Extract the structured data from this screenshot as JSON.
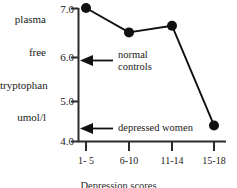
{
  "chart_data": {
    "type": "line",
    "title": "",
    "subtitle": "",
    "xlabel": "Depression scores",
    "ylabel": "plasma free tryptophan umol/l",
    "ylabel_lines": [
      "plasma",
      "free",
      "tryptophan",
      "umol/l"
    ],
    "categories": [
      "1- 5",
      "6-10",
      "11-14",
      "15-18"
    ],
    "values": [
      7.0,
      6.45,
      6.6,
      4.35
    ],
    "series": [
      {
        "name": "plasma free tryptophan",
        "values": [
          7.0,
          6.45,
          6.6,
          4.35
        ]
      }
    ],
    "ylim": [
      4.0,
      7.0
    ],
    "yticks": [
      "7.0",
      "6.0",
      "5.0",
      "4.0"
    ],
    "ytick_values": [
      7.0,
      6.0,
      5.0,
      4.0
    ],
    "grid": false,
    "legend": "none",
    "marker": "filled-circle",
    "line_color": "#111111",
    "marker_color": "#111111",
    "axis_color": "#2b2b2b",
    "annotations": [
      {
        "id": "normal-controls",
        "label_lines": [
          "normal",
          "controls"
        ],
        "label": "normal controls",
        "arrow": "left",
        "points_to_value": 6.0
      },
      {
        "id": "depressed-women",
        "label_lines": [
          "depressed  women"
        ],
        "label": "depressed women",
        "arrow": "left",
        "points_to_value": 4.3
      }
    ]
  }
}
